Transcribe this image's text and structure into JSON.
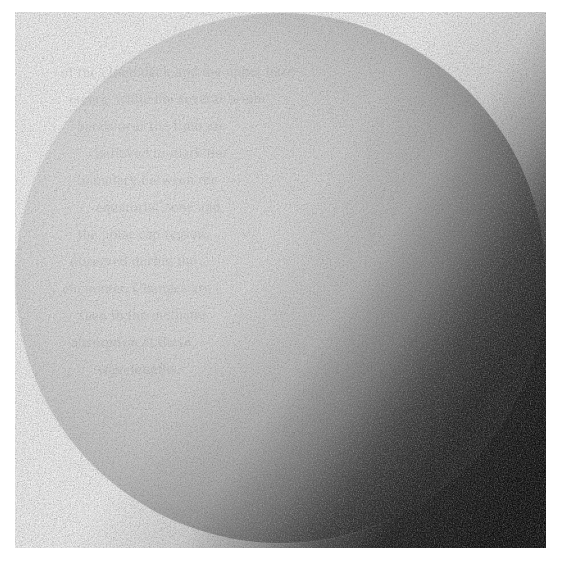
{
  "image": {
    "kind": "scanned-print-photograph",
    "subject": "planetary-disc",
    "caption_visible": false,
    "width_px": 561,
    "height_px": 564,
    "background_color": "#ffffff"
  },
  "disc": {
    "center_x_px": 280,
    "center_y_px": 278,
    "radius_px": 265,
    "shape": "circle",
    "phase": "gibbous",
    "illumination_direction": "upper-left",
    "terminator_edge": "dithered",
    "surface_detail": "featureless",
    "highlight_x_px": 150,
    "highlight_y_px": 220,
    "colors": {
      "highlight": "#ebebeb",
      "bright": "#e0e0e0",
      "light_mid": "#c9c9c9",
      "mid": "#a3a3a3",
      "dark_mid": "#6e6e6e",
      "shadow": "#1a1a1a",
      "terminator_black": "#050505"
    }
  },
  "ghost_text": {
    "note": "illegible bleed-through from reverse side of page",
    "legible": false,
    "opacity": 0.055,
    "lines": [
      "of the cloud deck and the upper haze",
      "layers, while the several bright",
      "bands near the limb are",
      "believed to mark the",
      "boundary between the",
      "equatorial zone and",
      "the polar cap region",
      "observed during the",
      "encounter. Changes are",
      "seen in the methane",
      "absorption at these",
      "wavelengths."
    ]
  },
  "grain": {
    "type": "halftone-print-noise",
    "opacity": 0.5,
    "base_frequency": 0.82
  }
}
